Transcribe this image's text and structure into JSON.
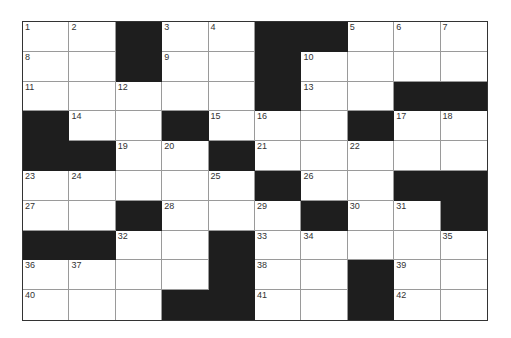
{
  "puzzle": {
    "rows": 10,
    "cols": 10,
    "colors": {
      "block": "#1e1e1e",
      "cell": "#ffffff",
      "line": "#9a9a9a",
      "border": "#333333"
    },
    "grid": [
      [
        "1",
        "2",
        "#",
        "3",
        "4",
        "#",
        "#",
        "5",
        "6",
        "7"
      ],
      [
        "8",
        "",
        "#",
        "9",
        "",
        "#",
        "10",
        "",
        "",
        ""
      ],
      [
        "11",
        "",
        "12",
        "",
        "",
        "#",
        "13",
        "",
        "#",
        "#"
      ],
      [
        "#",
        "14",
        "",
        "#",
        "15",
        "16",
        "",
        "#",
        "17",
        "18"
      ],
      [
        "#",
        "#",
        "19",
        "20",
        "#",
        "21",
        "",
        "22",
        "",
        ""
      ],
      [
        "23",
        "24",
        "",
        "",
        "25",
        "#",
        "26",
        "",
        "#",
        "#"
      ],
      [
        "27",
        "",
        "#",
        "28",
        "",
        "29",
        "#",
        "30",
        "31",
        "#"
      ],
      [
        "#",
        "#",
        "32",
        "",
        "#",
        "33",
        "34",
        "",
        "",
        "35"
      ],
      [
        "36",
        "37",
        "",
        "",
        "#",
        "38",
        "",
        "#",
        "39",
        ""
      ],
      [
        "40",
        "",
        "",
        "#",
        "#",
        "41",
        "",
        "#",
        "42",
        ""
      ]
    ]
  }
}
